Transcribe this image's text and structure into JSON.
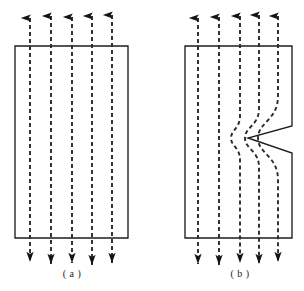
{
  "figure": {
    "background_color": "#ffffff",
    "line_color": "#1d1d1d",
    "flux_color": "#2a2a2a",
    "arrow_color": "#141414"
  },
  "panels": [
    {
      "id": "a",
      "caption": "( a )",
      "caption_x": 72,
      "caption_y": 277,
      "description": "Rectangular specimen with uniform parallel flux lines",
      "rect": {
        "x": 15,
        "y": 46,
        "width": 113,
        "height": 192
      },
      "defect": null,
      "flux_lines": [
        {
          "x": 30,
          "top": 18,
          "bottom": 262,
          "deflected": false
        },
        {
          "x": 51,
          "top": 16,
          "bottom": 264,
          "deflected": false
        },
        {
          "x": 72,
          "top": 17,
          "bottom": 263,
          "deflected": false
        },
        {
          "x": 92,
          "top": 16,
          "bottom": 265,
          "deflected": false
        },
        {
          "x": 112,
          "top": 15,
          "bottom": 263,
          "deflected": false
        }
      ]
    },
    {
      "id": "b",
      "caption": "( b )",
      "caption_x": 240,
      "caption_y": 277,
      "description": "Rectangular specimen with a V-shaped notch in the right edge; flux lines bend around the notch",
      "rect": {
        "x": 185,
        "y": 46,
        "width": 107,
        "height": 192
      },
      "defect": {
        "type": "v-notch",
        "edge": "right",
        "tip_x": 248,
        "tip_y": 138,
        "mouth_top_y": 126,
        "mouth_bottom_y": 153,
        "mouth_x": 292
      },
      "flux_lines": [
        {
          "x": 198,
          "top": 18,
          "bottom": 264,
          "deflected": false
        },
        {
          "x": 219,
          "top": 17,
          "bottom": 265,
          "deflected": false
        },
        {
          "x": 240,
          "top": 16,
          "bottom": 263,
          "deflected": true,
          "bend_amount": -9
        },
        {
          "x": 259,
          "top": 15,
          "bottom": 264,
          "deflected": true,
          "bend_amount": -14
        },
        {
          "x": 278,
          "top": 16,
          "bottom": 262,
          "deflected": true,
          "bend_amount": -20
        }
      ]
    }
  ],
  "legend": {
    "flux_line_label": "flux line",
    "specimen_label": "specimen",
    "notch_label": "notch"
  },
  "counts": {
    "panels": 2,
    "flux_lines_per_panel": 5
  }
}
